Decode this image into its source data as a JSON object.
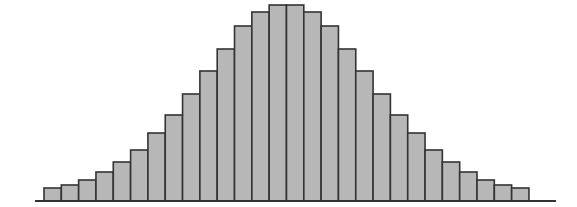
{
  "chart_data": {
    "type": "bar",
    "subtype": "histogram",
    "title": "",
    "xlabel": "",
    "ylabel": "",
    "categories": [
      "1",
      "2",
      "3",
      "4",
      "5",
      "6",
      "7",
      "8",
      "9",
      "10",
      "11",
      "12",
      "13",
      "14",
      "15",
      "16",
      "17",
      "18",
      "19",
      "20",
      "21",
      "22",
      "23",
      "24",
      "25",
      "26",
      "27",
      "28"
    ],
    "values": [
      13,
      16,
      21,
      29,
      39,
      51,
      68,
      86,
      107,
      130,
      152,
      175,
      189,
      196,
      196,
      189,
      175,
      152,
      130,
      107,
      86,
      68,
      51,
      39,
      29,
      21,
      16,
      13
    ],
    "ylim": [
      0,
      200
    ],
    "grid": false,
    "legend": null,
    "colors": {
      "bar_fill": "#b7b7b7",
      "bar_edge": "#333333",
      "axis": "#333333",
      "background": "#ffffff"
    },
    "layout": {
      "baseline_y": 201,
      "first_bar_x": 44,
      "bar_width": 17.32,
      "axis_x_start": 35,
      "axis_x_end": 556
    }
  }
}
